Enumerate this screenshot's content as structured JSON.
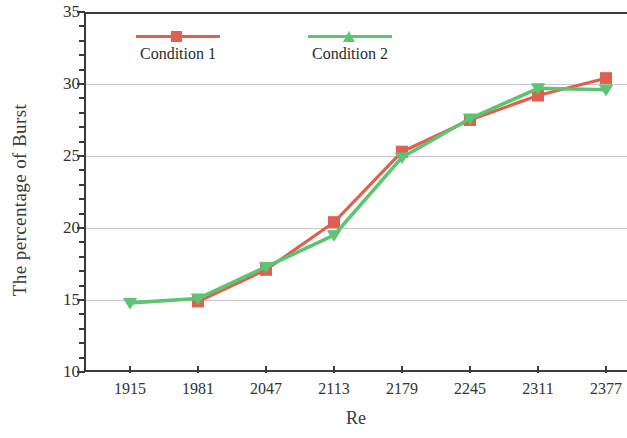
{
  "chart_data": {
    "type": "line",
    "title": "",
    "xlabel": "Re",
    "ylabel": "The percentage of Burst",
    "x": [
      1915,
      1981,
      2047,
      2113,
      2179,
      2245,
      2311,
      2377
    ],
    "categories": [
      "1915",
      "1981",
      "2047",
      "2113",
      "2179",
      "2245",
      "2311",
      "2377"
    ],
    "xlim": [
      1915,
      2377
    ],
    "ylim": [
      10,
      35
    ],
    "y_major_ticks": [
      10,
      15,
      20,
      25,
      30,
      35
    ],
    "y_tick_labels": [
      "10",
      "15",
      "20",
      "25",
      "30",
      "35"
    ],
    "y_minor_tick_step": 1,
    "grid": "horizontal-major",
    "legend_position": "top-left-inside",
    "series": [
      {
        "name": "Condition 1",
        "color": "#e0604f",
        "marker": "square",
        "values": [
          null,
          14.9,
          17.1,
          20.4,
          25.3,
          27.5,
          29.2,
          30.4
        ]
      },
      {
        "name": "Condition 2",
        "color": "#5cc472",
        "marker": "triangle",
        "values": [
          14.8,
          15.1,
          17.3,
          19.5,
          24.9,
          27.6,
          29.7,
          29.6
        ]
      }
    ]
  },
  "legend": {
    "items": [
      {
        "label": "Condition 1",
        "color": "#e0604f",
        "marker": "square"
      },
      {
        "label": "Condition 2",
        "color": "#5cc472",
        "marker": "triangle"
      }
    ]
  },
  "axes": {
    "y_title": "The percentage of Burst",
    "x_title": "Re"
  }
}
